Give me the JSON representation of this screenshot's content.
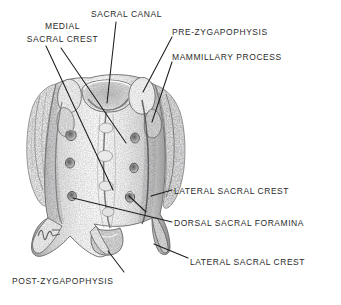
{
  "figure": {
    "view": "dorsal",
    "background_color": "#ffffff",
    "ink_color": "#2b2b2b",
    "width": 341,
    "height": 305
  },
  "labels": [
    {
      "id": "medial-sacral-crest",
      "lines": [
        "MEDIAL",
        "SACRAL CREST"
      ],
      "text": "MEDIAL SACRAL CREST",
      "x": 10,
      "y": 20,
      "align": "center"
    },
    {
      "id": "sacral-canal",
      "lines": [
        "SACRAL CANAL"
      ],
      "text": "SACRAL CANAL",
      "x": 91,
      "y": 8,
      "align": "left"
    },
    {
      "id": "pre-zygapophysis",
      "lines": [
        "PRE-ZYGAPOPHYSIS"
      ],
      "text": "PRE-ZYGAPOPHYSIS",
      "x": 172,
      "y": 26,
      "align": "left"
    },
    {
      "id": "mammillary-process",
      "lines": [
        "MAMMILLARY PROCESS"
      ],
      "text": "MAMMILLARY PROCESS",
      "x": 172,
      "y": 51,
      "align": "left"
    },
    {
      "id": "lateral-sacral-crest-upper",
      "lines": [
        "LATERAL SACRAL CREST"
      ],
      "text": "LATERAL SACRAL CREST",
      "x": 174,
      "y": 185,
      "align": "left"
    },
    {
      "id": "dorsal-sacral-foramina",
      "lines": [
        "DORSAL SACRAL FORAMINA"
      ],
      "text": "DORSAL SACRAL FORAMINA",
      "x": 174,
      "y": 217,
      "align": "left"
    },
    {
      "id": "lateral-sacral-crest-lower",
      "lines": [
        "LATERAL SACRAL CREST"
      ],
      "text": "LATERAL SACRAL CREST",
      "x": 190,
      "y": 256,
      "align": "left"
    },
    {
      "id": "post-zygapophysis",
      "lines": [
        "POST-ZYGAPOPHYSIS"
      ],
      "text": "POST-ZYGAPOPHYSIS",
      "x": 12,
      "y": 275,
      "align": "left"
    }
  ],
  "leaders": [
    {
      "id": "leader-medial-sacral-crest",
      "points": "46,46 113,190"
    },
    {
      "id": "leader-medial-sacral-crest-2",
      "points": "61,48 126,143"
    },
    {
      "id": "leader-sacral-canal",
      "points": "116,22 107,103"
    },
    {
      "id": "leader-pre-zygapophysis",
      "points": "172,37 143,92"
    },
    {
      "id": "leader-mammillary-process",
      "points": "172,62 152,122"
    },
    {
      "id": "leader-lateral-sacral-crest-upper",
      "points": "172,190 151,196"
    },
    {
      "id": "leader-dorsal-sacral-foramina-a",
      "points": "172,222 73,198"
    },
    {
      "id": "leader-dorsal-sacral-foramina-b",
      "points": "146,212 129,196"
    },
    {
      "id": "leader-lateral-sacral-crest-lower",
      "points": "188,258 154,244"
    },
    {
      "id": "leader-post-zygapophysis",
      "points": "124,272 108,251"
    }
  ],
  "artist_mark": {
    "id": "artist-monogram",
    "x": 42,
    "y": 228
  }
}
